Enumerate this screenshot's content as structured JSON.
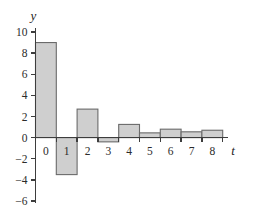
{
  "chart_data": {
    "type": "bar",
    "title": "",
    "xlabel": "t",
    "ylabel": "y",
    "categories": [
      "0",
      "1",
      "2",
      "3",
      "4",
      "5",
      "6",
      "7",
      "8"
    ],
    "values": [
      9,
      -3.5,
      2.7,
      -0.4,
      1.25,
      0.45,
      0.8,
      0.55,
      0.7
    ],
    "x": [
      0,
      1,
      2,
      3,
      4,
      5,
      6,
      7,
      8
    ],
    "ylim": [
      -6,
      10
    ],
    "xlim": [
      -0.5,
      8.9
    ],
    "y_ticks": [
      10,
      8,
      6,
      4,
      2,
      0,
      -2,
      -4,
      -6
    ],
    "y_tick_labels": [
      "10",
      "8",
      "6",
      "4",
      "2",
      "0",
      "-2",
      "-4",
      "-6"
    ],
    "x_ticks": [
      0,
      1,
      2,
      3,
      4,
      5,
      6,
      7,
      8
    ],
    "x_tick_labels": [
      "0",
      "1",
      "2",
      "3",
      "4",
      "5",
      "6",
      "7",
      "8"
    ],
    "grid": false,
    "legend": null,
    "bar_fill_color": "#cfcfcf",
    "bar_edge_color": "#6a6a6a",
    "axis_color": "#3d3d3d",
    "baseline_value": 0,
    "bar_width": 1.0
  }
}
